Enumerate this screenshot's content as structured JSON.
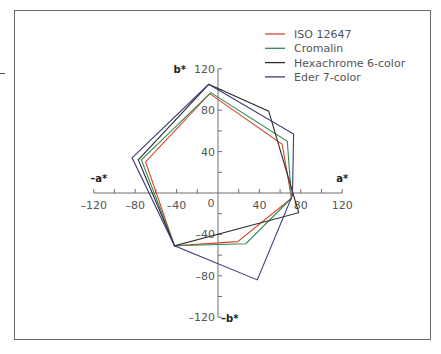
{
  "chart_data": {
    "type": "line",
    "subtype": "radar-polygon (CIELAB a*b* gamut plot)",
    "title": "",
    "xlabel_pos": "a*",
    "xlabel_neg": "–a*",
    "ylabel_pos": "b*",
    "ylabel_neg": "–b*",
    "xlim": [
      -120,
      120
    ],
    "ylim": [
      -120,
      120
    ],
    "x_ticks": [
      -120,
      -80,
      -40,
      0,
      40,
      80,
      120
    ],
    "x_tick_labels": [
      "–120",
      "–80",
      "–40",
      "0",
      "40",
      "80",
      "120"
    ],
    "y_ticks": [
      -120,
      -80,
      -40,
      40,
      80,
      120
    ],
    "y_tick_labels": [
      "–120",
      "–80",
      "–40",
      "40",
      "80",
      "120"
    ],
    "origin_label": "0",
    "minor_tick_step": 20,
    "grid": false,
    "legend_position": "upper right",
    "series": [
      {
        "name": "ISO 12647",
        "color": "#d9452c",
        "points": [
          [
            -8,
            96
          ],
          [
            62,
            47
          ],
          [
            71,
            -5
          ],
          [
            19,
            -47
          ],
          [
            -42,
            -51
          ],
          [
            -70,
            30
          ]
        ]
      },
      {
        "name": "Cromalin",
        "color": "#2f8a55",
        "points": [
          [
            -7,
            97
          ],
          [
            67,
            50
          ],
          [
            71,
            -5
          ],
          [
            27,
            -49
          ],
          [
            -42,
            -51
          ],
          [
            -74,
            32
          ]
        ]
      },
      {
        "name": "Hexachrome 6-color",
        "color": "#2b2b2b",
        "points": [
          [
            -9,
            105
          ],
          [
            49,
            79
          ],
          [
            78,
            -19
          ],
          [
            -42,
            -51
          ],
          [
            -77,
            32
          ]
        ]
      },
      {
        "name": "Eder 7-color",
        "color": "#3b3b7c",
        "points": [
          [
            -9,
            105
          ],
          [
            73,
            57
          ],
          [
            72,
            -2
          ],
          [
            38,
            -84
          ],
          [
            -42,
            -51
          ],
          [
            -83,
            34
          ]
        ]
      }
    ]
  },
  "plot": {
    "origin_px": [
      218,
      193
    ],
    "px_per_unit": 1.035
  }
}
